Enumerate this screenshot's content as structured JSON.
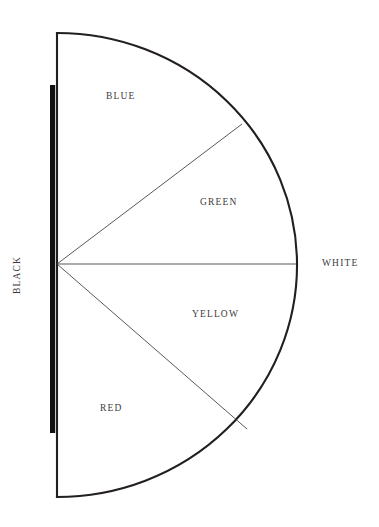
{
  "figure": {
    "background_color": "#ffffff",
    "ink_color": "#231f20",
    "text_color": "#3b3b3b"
  },
  "geometry": {
    "center": {
      "x": 57,
      "y": 264
    },
    "radius_x": 239,
    "radius_y": 231,
    "arc_start": {
      "x": 57,
      "y": 33
    },
    "arc_end": {
      "x": 57,
      "y": 497
    },
    "rightmost_point": {
      "x": 296,
      "y": 264
    }
  },
  "axis_labels": {
    "black": "BLACK",
    "white": "WHITE"
  },
  "black_bar": {
    "x": 50,
    "y_top": 85,
    "y_bottom": 433,
    "width": 5,
    "color": "#111111"
  },
  "regions": [
    {
      "id": "blue",
      "label": "BLUE",
      "label_x": 106,
      "label_y": 92
    },
    {
      "id": "green",
      "label": "GREEN",
      "label_x": 200,
      "label_y": 198
    },
    {
      "id": "yellow",
      "label": "YELLOW",
      "label_x": 192,
      "label_y": 310
    },
    {
      "id": "red",
      "label": "RED",
      "label_x": 100,
      "label_y": 404
    }
  ],
  "dividers": [
    {
      "id": "blue-green-divider",
      "from": {
        "x": 57,
        "y": 264
      },
      "to": {
        "x": 242,
        "y": 124
      }
    },
    {
      "id": "green-yellow-divider",
      "from": {
        "x": 57,
        "y": 264
      },
      "to": {
        "x": 296,
        "y": 264
      }
    },
    {
      "id": "yellow-red-divider",
      "from": {
        "x": 57,
        "y": 264
      },
      "to": {
        "x": 247,
        "y": 429
      }
    }
  ]
}
